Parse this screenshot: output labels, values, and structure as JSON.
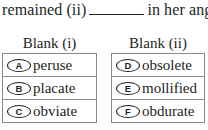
{
  "sentence": {
    "before": "remained (ii)",
    "after": "in her anger."
  },
  "columns": [
    {
      "title": "Blank (i)",
      "options": [
        {
          "letter": "A",
          "word": "peruse"
        },
        {
          "letter": "B",
          "word": "placate"
        },
        {
          "letter": "C",
          "word": "obviate"
        }
      ]
    },
    {
      "title": "Blank (ii)",
      "options": [
        {
          "letter": "D",
          "word": "obsolete"
        },
        {
          "letter": "E",
          "word": "mollified"
        },
        {
          "letter": "F",
          "word": "obdurate"
        }
      ]
    }
  ]
}
